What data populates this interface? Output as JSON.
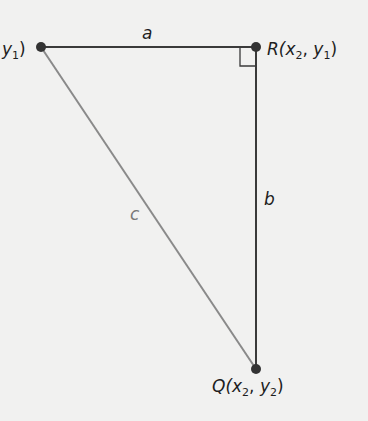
{
  "diagram": {
    "title": "",
    "points": {
      "P": {
        "label_tail": "y",
        "sub": "1",
        "close": ")",
        "x": 41,
        "y": 47
      },
      "R": {
        "name": "R(",
        "x_var": "x",
        "x_sub": "2",
        "sep": ", ",
        "y_var": "y",
        "y_sub": "1",
        "close": ")",
        "x": 256,
        "y": 47
      },
      "Q": {
        "name": "Q(",
        "x_var": "x",
        "x_sub": "2",
        "sep": ", ",
        "y_var": "y",
        "y_sub": "2",
        "close": ")",
        "x": 256,
        "y": 369
      }
    },
    "sides": {
      "a": "a",
      "b": "b",
      "c": "c"
    },
    "colors": {
      "leg": "#3a3a3a",
      "hypotenuse": "#8a8a8a",
      "point": "#333333",
      "background": "#f1f1f0"
    },
    "right_angle_marker": true
  }
}
